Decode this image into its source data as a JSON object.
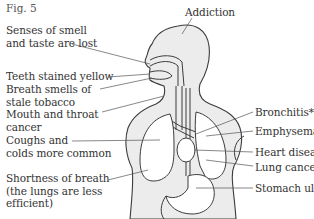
{
  "figure": {
    "label": "Fig. 5"
  },
  "labels": {
    "top": "Addiction",
    "left": [
      {
        "id": "senses",
        "lines": [
          "Senses of smell",
          "and taste are lost"
        ]
      },
      {
        "id": "teeth",
        "lines": [
          "Teeth stained yellow"
        ]
      },
      {
        "id": "breath",
        "lines": [
          "Breath smells of",
          "stale tobacco"
        ]
      },
      {
        "id": "mouth-throat",
        "lines": [
          "Mouth and throat",
          "cancer"
        ]
      },
      {
        "id": "coughs",
        "lines": [
          "Coughs and",
          "colds more common"
        ]
      },
      {
        "id": "shortness",
        "lines": [
          "Shortness of breath",
          "(the lungs are less",
          "efficient)"
        ]
      }
    ],
    "right": [
      {
        "id": "bronchitis",
        "text": "Bronchitis*"
      },
      {
        "id": "emphysema",
        "text": "Emphysema**"
      },
      {
        "id": "heart",
        "text": "Heart disease"
      },
      {
        "id": "lung-cancer",
        "text": "Lung cancer"
      },
      {
        "id": "stomach",
        "text": "Stomach ulcer"
      }
    ]
  }
}
